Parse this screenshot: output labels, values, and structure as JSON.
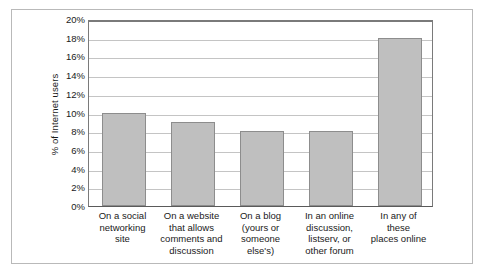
{
  "chart_data": {
    "type": "bar",
    "title": "",
    "subtitle": "",
    "xlabel": "",
    "ylabel": "% of Internet users",
    "ylim": [
      0,
      20
    ],
    "ytick_values": [
      20,
      18,
      16,
      14,
      12,
      10,
      8,
      6,
      4,
      2,
      0
    ],
    "ytick_labels": [
      "20%",
      "18%",
      "16%",
      "14%",
      "12%",
      "10%",
      "8%",
      "6%",
      "4%",
      "2%",
      "0%"
    ],
    "grid": true,
    "grid_axis": "y",
    "legend": false,
    "legend_position": "none",
    "categories": [
      "On a social networking site",
      "On a website that allows comments and discussion",
      "On a blog (yours or someone else's)",
      "In an online discussion, listserv, or other forum",
      "In any of these places online"
    ],
    "category_lines": [
      [
        "On a social",
        "networking",
        "site"
      ],
      [
        "On a website",
        "that allows",
        "comments and",
        "discussion"
      ],
      [
        "On a blog",
        "(yours or",
        "someone",
        "else's)"
      ],
      [
        "In an online",
        "discussion,",
        "listserv, or",
        "other forum"
      ],
      [
        "In any of",
        "these",
        "places online"
      ]
    ],
    "values": [
      10,
      9,
      8,
      8,
      18
    ],
    "value_labels": [
      "10%",
      "9%",
      "8%",
      "8%",
      "18%"
    ],
    "colors": {
      "bar_fill": "#bfbfbf",
      "bar_stroke": "#8d8d8d",
      "gridline": "#c4c4c4",
      "axis": "#7a7a7a",
      "frame": "#b9b9b9",
      "text": "#1a1a1a",
      "background": "#ffffff"
    }
  }
}
